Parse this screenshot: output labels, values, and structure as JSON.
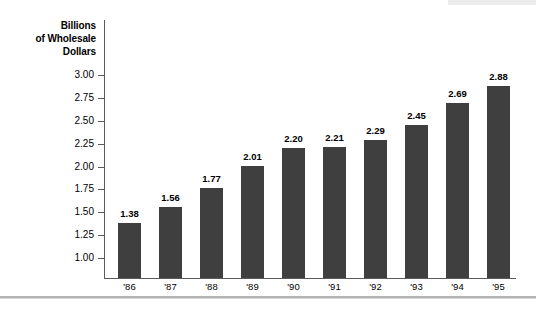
{
  "chart_data": {
    "type": "bar",
    "title": "",
    "xlabel": "",
    "ylabel": "Billions of Wholesale Dollars",
    "ylabel_lines": [
      "Billions",
      "of Wholesale",
      "Dollars"
    ],
    "categories": [
      "'86",
      "'87",
      "'88",
      "'89",
      "'90",
      "'91",
      "'92",
      "'93",
      "'94",
      "'95"
    ],
    "values": [
      1.38,
      1.56,
      1.77,
      2.01,
      2.2,
      2.21,
      2.29,
      2.45,
      2.69,
      2.88
    ],
    "value_labels": [
      "1.38",
      "1.56",
      "1.77",
      "2.01",
      "2.20",
      "2.21",
      "2.29",
      "2.45",
      "2.69",
      "2.88"
    ],
    "ylim": [
      1.0,
      3.0
    ],
    "ytick_labels": [
      "3.00",
      "2.75",
      "2.50",
      "2.25",
      "2.00",
      "1.75",
      "1.50",
      "1.25",
      "1.00"
    ],
    "ytick_values": [
      3.0,
      2.75,
      2.5,
      2.25,
      2.0,
      1.75,
      1.5,
      1.25,
      1.0
    ],
    "grid": false,
    "legend": null,
    "bar_color": "#3f3f3f",
    "axis_color": "#5a5a5a",
    "text_color": "#000000",
    "background": "#ffffff"
  },
  "decor": {
    "top_band_color": "#ececec",
    "bottom_rule_color": "#b4b4b4"
  }
}
